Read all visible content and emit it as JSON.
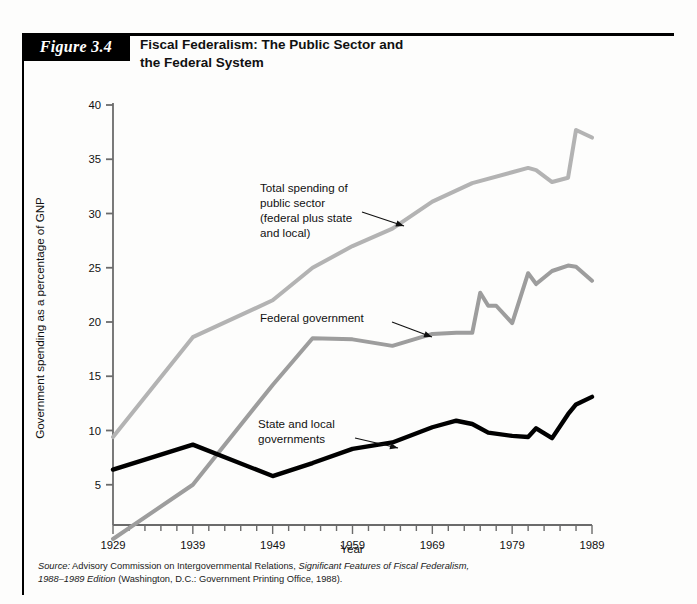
{
  "figure": {
    "tag": "Figure 3.4",
    "title_line1": "Fiscal Federalism: The Public Sector and",
    "title_line2": "the Federal System"
  },
  "source": {
    "label": "Source:",
    "line1_part1": " Advisory Commission on Intergovernmental Relations, ",
    "line1_italic": "Significant Features of Fiscal Federalism,",
    "line2_italic": "1988–1989 Edition",
    "line2_part2": " (Washington, D.C.: Government Printing Office, 1988)."
  },
  "annotations": [
    {
      "name": "total-spending",
      "lines": [
        "Total spending of",
        "public sector",
        "(federal plus state",
        "and local)"
      ],
      "x": 260,
      "y": 192,
      "arrow": {
        "x1": 362,
        "y1": 212,
        "x2": 404,
        "y2": 226
      }
    },
    {
      "name": "federal-government",
      "lines": [
        "Federal government"
      ],
      "x": 260,
      "y": 322,
      "arrow": {
        "x1": 392,
        "y1": 322,
        "x2": 432,
        "y2": 337
      }
    },
    {
      "name": "state-local-governments",
      "lines": [
        "State and local",
        "governments"
      ],
      "x": 258,
      "y": 428,
      "arrow": {
        "x1": 355,
        "y1": 438,
        "x2": 398,
        "y2": 448
      }
    }
  ],
  "colors": {
    "total_spending": "#b3b3b3",
    "federal": "#9d9d9d",
    "state_local": "#000000",
    "axis": "#6b6b6b",
    "text": "#111111",
    "tag_background": "#000000",
    "tag_text": "#ffffff"
  },
  "chart_data": {
    "type": "line",
    "title": "Fiscal Federalism: The Public Sector and the Federal System",
    "xlabel": "Year",
    "ylabel": "Government spending as a percentage of GNP",
    "xlim": [
      1929,
      1989
    ],
    "ylim": [
      0,
      40
    ],
    "yticks": [
      5,
      10,
      15,
      20,
      25,
      30,
      35,
      40
    ],
    "xticks": [
      1929,
      1939,
      1949,
      1959,
      1969,
      1979,
      1989
    ],
    "x_minor_tick_step": 2,
    "grid": false,
    "legend": "in-plot annotations",
    "series": [
      {
        "name": "Total spending of public sector (federal plus state and local)",
        "color": "#b3b3b3",
        "x": [
          1929,
          1939,
          1949,
          1954,
          1959,
          1964,
          1969,
          1974,
          1979,
          1981,
          1982,
          1984,
          1986,
          1987,
          1989
        ],
        "values": [
          9.4,
          18.6,
          22.0,
          25.0,
          27.0,
          28.6,
          31.1,
          32.8,
          33.8,
          34.2,
          34.0,
          32.9,
          33.3,
          37.7,
          37.0
        ]
      },
      {
        "name": "Federal government",
        "color": "#9d9d9d",
        "x": [
          1929,
          1939,
          1949,
          1954,
          1959,
          1964,
          1969,
          1972,
          1974,
          1975,
          1976,
          1977,
          1979,
          1981,
          1982,
          1984,
          1986,
          1987,
          1989
        ],
        "values": [
          0.0,
          5.0,
          14.2,
          18.5,
          18.4,
          17.8,
          18.9,
          19.0,
          19.0,
          22.7,
          21.5,
          21.5,
          19.9,
          24.5,
          23.5,
          24.7,
          25.2,
          25.1,
          23.8
        ]
      },
      {
        "name": "State and local governments",
        "color": "#000000",
        "x": [
          1929,
          1939,
          1949,
          1954,
          1959,
          1964,
          1969,
          1972,
          1974,
          1976,
          1979,
          1981,
          1982,
          1984,
          1986,
          1987,
          1989
        ],
        "values": [
          6.4,
          8.7,
          5.8,
          7.0,
          8.3,
          8.9,
          10.3,
          10.9,
          10.6,
          9.8,
          9.5,
          9.4,
          10.2,
          9.3,
          11.5,
          12.4,
          13.1
        ]
      }
    ]
  }
}
